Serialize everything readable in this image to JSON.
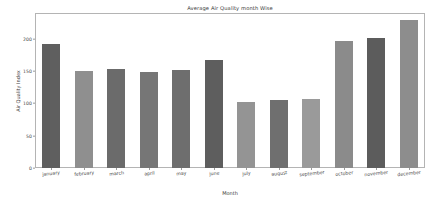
{
  "chart_data": {
    "type": "bar",
    "title": "Average Air Quality month Wise",
    "xlabel": "Month",
    "ylabel": "Air Quality Index",
    "categories": [
      "january",
      "february",
      "march",
      "april",
      "may",
      "june",
      "july",
      "august",
      "september",
      "october",
      "november",
      "december"
    ],
    "values": [
      192,
      150,
      154,
      149,
      152,
      168,
      102,
      105,
      107,
      196,
      201,
      229
    ],
    "bar_colors": [
      "#5f5f5f",
      "#8f8f8f",
      "#6b6b6b",
      "#767676",
      "#6e6e6e",
      "#5e5e5e",
      "#949494",
      "#6f6f6f",
      "#9a9a9a",
      "#8b8b8b",
      "#5c5c5c",
      "#8d8d8d"
    ],
    "ylim": [
      0,
      240
    ],
    "yticks": [
      0,
      50,
      100,
      150,
      200
    ],
    "ytick_labels": [
      "0",
      "50",
      "100",
      "150",
      "200"
    ],
    "grid": false,
    "legend": null,
    "axis_color": "#b4b4b4",
    "tick_color": "#4a4a4a",
    "background": "#ffffff"
  }
}
